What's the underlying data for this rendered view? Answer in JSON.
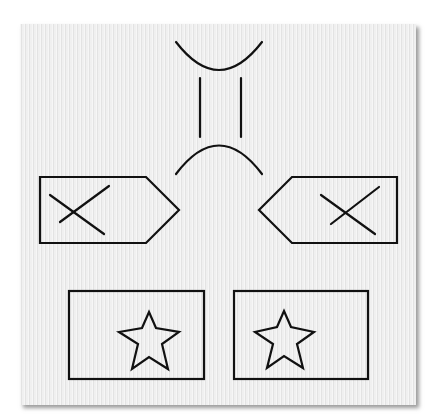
{
  "figure": {
    "type": "geometric-shapes-diagram",
    "background_color": "#ececec",
    "stroke_color": "#111111",
    "shapes": {
      "top_curve": {
        "kind": "upward-open parabola",
        "points": [
          [
            176,
            42
          ],
          [
            219,
            70
          ],
          [
            262,
            42
          ]
        ]
      },
      "vertical_lines": [
        {
          "kind": "line",
          "x": 200,
          "y1": 78,
          "y2": 137
        },
        {
          "kind": "line",
          "x": 241,
          "y1": 78,
          "y2": 137
        }
      ],
      "bottom_curve": {
        "kind": "downward-open arc",
        "points": [
          [
            176,
            174
          ],
          [
            219,
            145
          ],
          [
            262,
            174
          ]
        ]
      },
      "left_pentagon": {
        "kind": "arrow-pentagon pointing right",
        "points": [
          [
            40,
            177
          ],
          [
            146,
            177
          ],
          [
            179,
            210
          ],
          [
            146,
            243
          ],
          [
            40,
            243
          ]
        ],
        "mark": "x-cross"
      },
      "right_pentagon": {
        "kind": "arrow-pentagon pointing left",
        "points": [
          [
            292,
            177
          ],
          [
            397,
            177
          ],
          [
            397,
            243
          ],
          [
            292,
            243
          ],
          [
            259,
            210
          ]
        ],
        "mark": "x-cross"
      },
      "left_rectangle": {
        "kind": "rectangle",
        "x": 69,
        "y": 291,
        "width": 135,
        "height": 88,
        "mark": "star-outline"
      },
      "right_rectangle": {
        "kind": "rectangle",
        "x": 234,
        "y": 291,
        "width": 134,
        "height": 88,
        "mark": "star-outline"
      }
    }
  }
}
